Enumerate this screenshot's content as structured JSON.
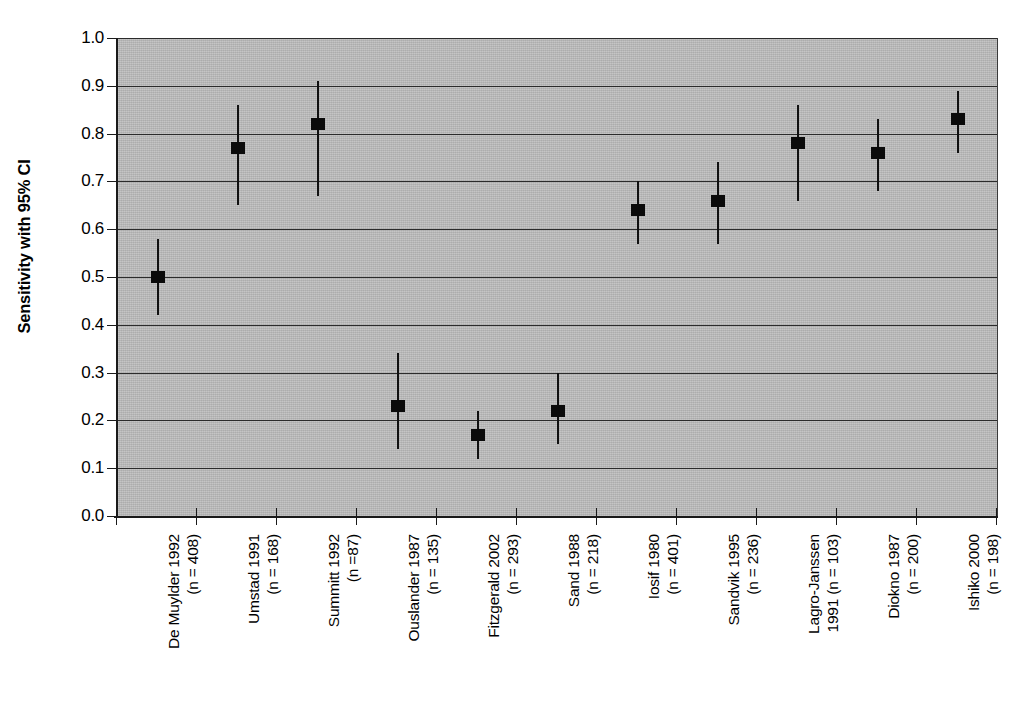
{
  "chart_data": {
    "type": "scatter",
    "title": "",
    "xlabel": "",
    "ylabel": "Sensitivity with 95% CI",
    "ylim": [
      0.0,
      1.0
    ],
    "grid": true,
    "legend": null,
    "error_bars": "95% confidence interval",
    "y_ticks": [
      "0.0",
      "0.1",
      "0.2",
      "0.3",
      "0.4",
      "0.5",
      "0.6",
      "0.7",
      "0.8",
      "0.9",
      "1.0"
    ],
    "y_tick_values": [
      0.0,
      0.1,
      0.2,
      0.3,
      0.4,
      0.5,
      0.6,
      0.7,
      0.8,
      0.9,
      1.0
    ],
    "categories": [
      "De Muylder 1992\n(n = 408)",
      "Umstad 1991\n(n = 168)",
      "Summitt 1992\n(n =87)",
      "Ouslander 1987\n(n = 135)",
      "Fitzgerald 2002\n(n = 293)",
      "Sand 1988\n(n = 218)",
      "Iosif 1980\n(n = 401)",
      "Sandvik 1995\n(n = 236)",
      "Lagro-Janssen\n1991 (n = 103)",
      "Diokno 1987\n(n = 200)",
      "Ishiko 2000\n(n = 198)"
    ],
    "values": [
      0.5,
      0.77,
      0.82,
      0.23,
      0.17,
      0.22,
      0.64,
      0.66,
      0.78,
      0.76,
      0.83
    ],
    "ci_lower": [
      0.42,
      0.65,
      0.67,
      0.14,
      0.12,
      0.15,
      0.57,
      0.57,
      0.66,
      0.68,
      0.76
    ],
    "ci_upper": [
      0.58,
      0.86,
      0.91,
      0.34,
      0.22,
      0.3,
      0.7,
      0.74,
      0.86,
      0.83,
      0.89
    ],
    "study_names": [
      "De Muylder 1992",
      "Umstad 1991",
      "Summitt 1992",
      "Ouslander 1987",
      "Fitzgerald 2002",
      "Sand 1988",
      "Iosif 1980",
      "Sandvik 1995",
      "Lagro-Janssen 1991",
      "Diokno 1987",
      "Ishiko 2000"
    ],
    "sample_sizes": [
      408,
      168,
      87,
      135,
      293,
      218,
      401,
      236,
      103,
      200,
      198
    ],
    "colors": {
      "plot_background": "#b9b9b9",
      "gridline": "#2b2b2b",
      "marker": "#0a0a0a",
      "axis": "#1a1a1a",
      "page_background": "#ffffff"
    }
  }
}
